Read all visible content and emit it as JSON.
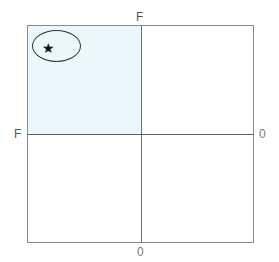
{
  "diagram": {
    "type": "quadrant-grid",
    "axis_labels": {
      "top": "F",
      "left": "F",
      "right": "0",
      "bottom": "0"
    },
    "highlighted_quadrant": "top-left",
    "highlight_color": "#eaf8fb",
    "marker": {
      "icon": "star-icon",
      "glyph": "★",
      "enclosure": "ellipse",
      "quadrant": "top-left"
    }
  }
}
